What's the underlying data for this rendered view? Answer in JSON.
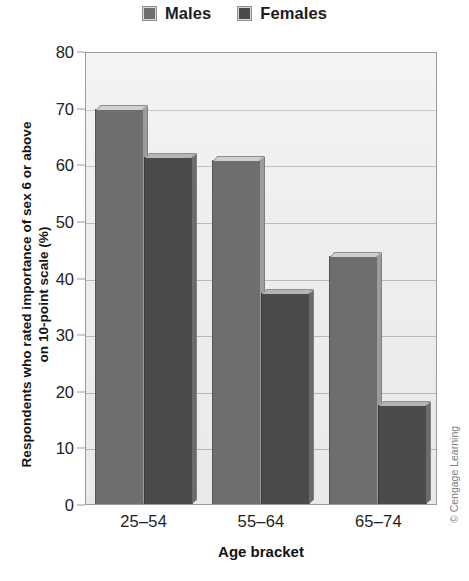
{
  "legend": {
    "position": "top-center",
    "entries": [
      {
        "label": "Males",
        "color": "#6e6e6e",
        "icon": "legend-swatch-icon"
      },
      {
        "label": "Females",
        "color": "#4b4b4b",
        "icon": "legend-swatch-icon"
      }
    ]
  },
  "axes": {
    "y_title_line1": "Respondents who rated importance of sex 6 or above",
    "y_title_line2": "on 10-point scale (%)",
    "x_title": "Age bracket",
    "y_ticks": [
      "0",
      "10",
      "20",
      "30",
      "40",
      "50",
      "60",
      "70",
      "80"
    ],
    "x_ticks": [
      "25–54",
      "55–64",
      "65–74"
    ]
  },
  "credit": "© Cengage Learning",
  "chart_data": {
    "type": "bar",
    "title": "",
    "subtitle": "",
    "xlabel": "Age bracket",
    "ylabel": "Respondents who rated importance of sex 6 or above on 10-point scale (%)",
    "categories": [
      "25–54",
      "55–64",
      "65–74"
    ],
    "series": [
      {
        "name": "Males",
        "color": "#6e6e6e",
        "values": [
          70.0,
          61.0,
          44.0
        ]
      },
      {
        "name": "Females",
        "color": "#4b4b4b",
        "values": [
          61.5,
          37.5,
          17.5
        ]
      }
    ],
    "ylim": [
      0,
      80
    ],
    "ytick_step": 10,
    "grid": true,
    "grid_axis": "y",
    "legend_position": "top-center",
    "orientation": "vertical",
    "bar_style": "3d-shaded",
    "plot_background": "#eeeeee"
  }
}
